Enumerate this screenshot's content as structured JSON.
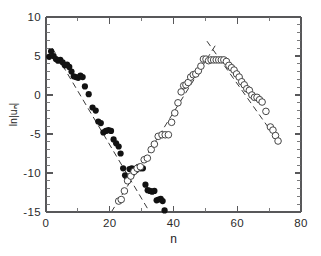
{
  "figure": {
    "background_color": "#ffffff",
    "axis_color": "#58585a",
    "filled_marker_color": "#121212",
    "open_marker_color": "#3c3c3c",
    "fit_line_color": "#3a3a3a"
  },
  "chart_data": {
    "type": "scatter",
    "title": "",
    "xlabel": "n",
    "ylabel": "ln|uₙ|",
    "xlim": [
      0,
      80
    ],
    "ylim": [
      -15,
      10
    ],
    "xticks": [
      0,
      20,
      40,
      60,
      80
    ],
    "xticklabels": [
      "0",
      "20",
      "40",
      "60",
      "80"
    ],
    "xminor_step": 10,
    "yticks": [
      -15,
      -10,
      -5,
      0,
      5,
      10
    ],
    "yticklabels": [
      "-15",
      "-10",
      "-5",
      "0",
      "5",
      "10"
    ],
    "yminor_step": 1,
    "grid": false,
    "legend": null,
    "series": [
      {
        "name": "filled-circles",
        "marker": "filled-circle",
        "marker_size": 3.1,
        "points": [
          [
            1.0,
            4.9
          ],
          [
            1.6,
            5.6
          ],
          [
            2.4,
            5.0
          ],
          [
            3.1,
            4.6
          ],
          [
            3.8,
            4.4
          ],
          [
            4.5,
            4.5
          ],
          [
            5.2,
            4.2
          ],
          [
            5.9,
            3.8
          ],
          [
            6.6,
            3.9
          ],
          [
            7.3,
            3.6
          ],
          [
            8.0,
            3.0
          ],
          [
            8.7,
            2.4
          ],
          [
            9.4,
            2.3
          ],
          [
            10.1,
            2.2
          ],
          [
            10.8,
            2.5
          ],
          [
            11.5,
            2.3
          ],
          [
            12.2,
            1.1
          ],
          [
            13.4,
            0.1
          ],
          [
            14.6,
            -1.6
          ],
          [
            15.6,
            -2.0
          ],
          [
            16.4,
            -3.4
          ],
          [
            17.2,
            -3.6
          ],
          [
            18.0,
            -4.8
          ],
          [
            18.8,
            -4.6
          ],
          [
            19.6,
            -4.5
          ],
          [
            20.4,
            -4.6
          ],
          [
            21.2,
            -5.7
          ],
          [
            22.0,
            -6.2
          ],
          [
            22.8,
            -6.6
          ],
          [
            23.4,
            -7.5
          ],
          [
            24.2,
            -9.4
          ],
          [
            24.8,
            -10.3
          ],
          [
            25.4,
            -10.6
          ],
          [
            26.2,
            -9.5
          ],
          [
            26.9,
            -9.4
          ],
          [
            27.6,
            -9.5
          ],
          [
            28.3,
            -9.6
          ],
          [
            29.0,
            -9.2
          ],
          [
            29.7,
            -9.4
          ],
          [
            30.4,
            -9.4
          ],
          [
            31.2,
            -11.5
          ],
          [
            31.9,
            -12.2
          ],
          [
            32.6,
            -12.3
          ],
          [
            33.3,
            -12.4
          ],
          [
            34.0,
            -12.3
          ],
          [
            34.7,
            -13.5
          ],
          [
            35.3,
            -13.4
          ],
          [
            36.0,
            -13.3
          ],
          [
            36.6,
            -13.6
          ],
          [
            37.2,
            -14.8
          ]
        ]
      },
      {
        "name": "open-circles",
        "marker": "open-circle",
        "marker_size": 3.3,
        "points": [
          [
            22.8,
            -13.6
          ],
          [
            23.6,
            -13.4
          ],
          [
            24.6,
            -12.3
          ],
          [
            25.6,
            -11.0
          ],
          [
            26.6,
            -10.4
          ],
          [
            27.6,
            -9.8
          ],
          [
            28.6,
            -9.4
          ],
          [
            29.6,
            -9.2
          ],
          [
            30.8,
            -8.3
          ],
          [
            31.8,
            -8.1
          ],
          [
            33.0,
            -7.0
          ],
          [
            34.0,
            -6.3
          ],
          [
            35.2,
            -5.3
          ],
          [
            36.4,
            -5.1
          ],
          [
            37.4,
            -5.1
          ],
          [
            38.4,
            -5.1
          ],
          [
            39.4,
            -3.5
          ],
          [
            40.4,
            -2.3
          ],
          [
            41.4,
            -1.0
          ],
          [
            42.4,
            0.4
          ],
          [
            43.2,
            1.2
          ],
          [
            43.9,
            1.3
          ],
          [
            44.6,
            1.6
          ],
          [
            45.4,
            2.3
          ],
          [
            46.2,
            2.6
          ],
          [
            47.0,
            2.7
          ],
          [
            47.8,
            3.1
          ],
          [
            48.6,
            3.7
          ],
          [
            49.4,
            4.6
          ],
          [
            50.2,
            4.6
          ],
          [
            51.0,
            4.4
          ],
          [
            51.8,
            4.5
          ],
          [
            52.6,
            4.5
          ],
          [
            53.4,
            4.5
          ],
          [
            54.2,
            4.5
          ],
          [
            55.0,
            4.5
          ],
          [
            55.8,
            4.5
          ],
          [
            56.6,
            4.3
          ],
          [
            57.4,
            3.8
          ],
          [
            58.2,
            3.5
          ],
          [
            59.0,
            3.2
          ],
          [
            59.8,
            2.7
          ],
          [
            60.6,
            2.3
          ],
          [
            61.4,
            1.7
          ],
          [
            62.2,
            1.3
          ],
          [
            63.0,
            0.8
          ],
          [
            63.8,
            0.6
          ],
          [
            64.6,
            0.0
          ],
          [
            65.4,
            -0.3
          ],
          [
            66.2,
            -0.3
          ],
          [
            67.0,
            -0.6
          ],
          [
            67.8,
            -0.9
          ],
          [
            69.0,
            -2.1
          ],
          [
            70.4,
            -4.1
          ],
          [
            71.2,
            -4.5
          ],
          [
            72.0,
            -5.2
          ],
          [
            72.8,
            -5.9
          ]
        ]
      }
    ],
    "fit_lines": [
      {
        "name": "left-decay-fit",
        "x": [
          2.0,
          32.5
        ],
        "y": [
          6.0,
          -15.0
        ]
      },
      {
        "name": "center-rise-fit",
        "x": [
          20.5,
          53.5
        ],
        "y": [
          -15.0,
          6.6
        ]
      },
      {
        "name": "right-decay-fit",
        "x": [
          50.5,
          74.0
        ],
        "y": [
          6.9,
          -6.6
        ]
      }
    ]
  }
}
